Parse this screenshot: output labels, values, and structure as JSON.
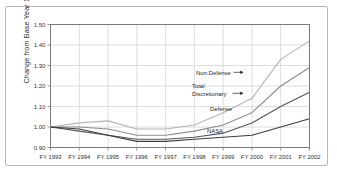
{
  "figure": {
    "background_color": "#ffffff",
    "frame_color": "#b9b9b9"
  },
  "chart_data": {
    "type": "line",
    "title": "",
    "xlabel": "",
    "ylabel": "Change from Base Year 1993",
    "categories": [
      "FY 1993",
      "FY 1994",
      "FY 1995",
      "FY 1996",
      "FY 1997",
      "FY 1998",
      "FY 1999",
      "FY 2000",
      "FY 2001",
      "FY 2002"
    ],
    "ylim": [
      0.9,
      1.5
    ],
    "yticks": [
      "0.90",
      "1.00",
      "1.10",
      "1.20",
      "1.30",
      "1.40",
      "1.50"
    ],
    "ytick_values": [
      0.9,
      1.0,
      1.1,
      1.2,
      1.3,
      1.4,
      1.5
    ],
    "grid": true,
    "legend_position": "inline-annotations",
    "series": [
      {
        "name": "Non-Defense",
        "color": "#b4b4b4",
        "values": [
          1.0,
          1.02,
          1.03,
          0.99,
          0.99,
          1.01,
          1.07,
          1.14,
          1.33,
          1.42
        ]
      },
      {
        "name": "Total Discretionary",
        "color": "#8c8c8c",
        "values": [
          1.0,
          1.0,
          0.99,
          0.96,
          0.96,
          0.98,
          1.01,
          1.07,
          1.2,
          1.29
        ]
      },
      {
        "name": "Defense",
        "color": "#555555",
        "values": [
          1.0,
          0.98,
          0.96,
          0.94,
          0.94,
          0.95,
          0.97,
          1.02,
          1.1,
          1.17
        ]
      },
      {
        "name": "NASA",
        "color": "#3c3c3c",
        "values": [
          1.0,
          0.99,
          0.96,
          0.93,
          0.93,
          0.94,
          0.95,
          0.96,
          1.0,
          1.04
        ]
      }
    ],
    "annotations": [
      {
        "text": "Non-Defense",
        "series": "Non-Defense",
        "arrow": "right"
      },
      {
        "text": "Total",
        "text2": "Discretionary",
        "series": "Total Discretionary",
        "arrow": "right"
      },
      {
        "text": "Defense",
        "series": "Defense",
        "arrow": "none"
      },
      {
        "text": "NASA",
        "series": "NASA",
        "arrow": "none"
      }
    ]
  }
}
